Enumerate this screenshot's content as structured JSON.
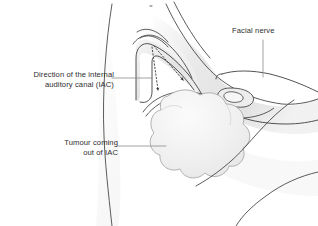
{
  "figure": {
    "type": "medical-anatomical-illustration",
    "view": "lateral cross-section of the skull base / cerebellopontine angle",
    "background_color": "#ffffff",
    "line_color": "#3a3a3a",
    "leader_color": "#8c8c8c",
    "tumour_fill": "#f0f0f0",
    "tumour_outline": "#9a9a9a",
    "shading_color": "#e3e3e3",
    "text_color": "#2e2e2e"
  },
  "labels": {
    "iac": {
      "line1": "Direction of the internal",
      "line2": "auditory canal (IAC)",
      "align": "right",
      "leader": "horizontal line to dotted arrow origin"
    },
    "tumour": {
      "line1": "Tumour coming",
      "line2": "out of IAC",
      "align": "right",
      "leader": "horizontal line to tumour mass"
    },
    "facial_nerve": {
      "line1": "Facial nerve",
      "align": "left",
      "leader": "vertical line down to nerve"
    }
  },
  "annotations": {
    "dotted_arrows": [
      {
        "name": "iac-direction-arrow-lower",
        "from": [
          152,
          48
        ],
        "to": [
          159,
          93
        ],
        "style": "dotted",
        "head": "filled-triangle"
      },
      {
        "name": "iac-direction-arrow-upper",
        "from": [
          153,
          47
        ],
        "to": [
          185,
          83
        ],
        "style": "dotted",
        "head": "filled-triangle"
      }
    ]
  },
  "structures": [
    {
      "name": "skull-outline",
      "description": "outer cranial and facial contour"
    },
    {
      "name": "internal-auditory-canal",
      "description": "bony canal running from petrous apex toward the tumour"
    },
    {
      "name": "tumour-mass",
      "description": "lobulated vestibular schwannoma bulging out of the IAC into the cerebellopontine angle"
    },
    {
      "name": "facial-nerve",
      "description": "thin curved nerve line running over the tumour"
    },
    {
      "name": "cochlea-vestibule",
      "description": "bean-shaped inner ear structure"
    },
    {
      "name": "jaw-outline",
      "description": "lower facial / mandible contour"
    }
  ]
}
